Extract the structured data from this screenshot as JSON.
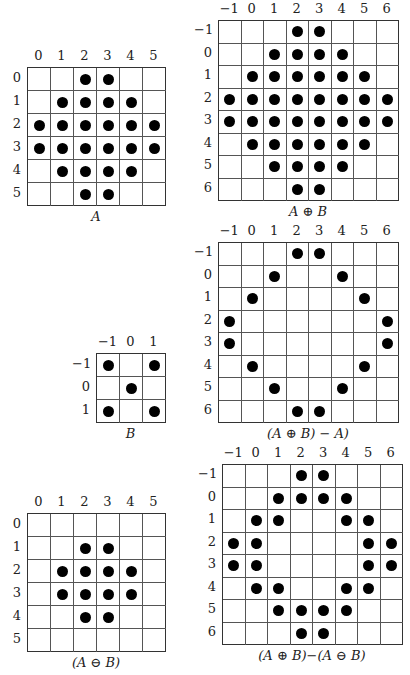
{
  "figures": [
    {
      "id": "A",
      "caption": "A",
      "cols": [
        0,
        1,
        2,
        3,
        4,
        5
      ],
      "rows": [
        0,
        1,
        2,
        3,
        4,
        5
      ],
      "x": 27,
      "y": 67,
      "cell": 23,
      "points": [
        [
          0,
          2
        ],
        [
          0,
          3
        ],
        [
          1,
          1
        ],
        [
          1,
          2
        ],
        [
          1,
          3
        ],
        [
          1,
          4
        ],
        [
          2,
          0
        ],
        [
          2,
          1
        ],
        [
          2,
          2
        ],
        [
          2,
          3
        ],
        [
          2,
          4
        ],
        [
          2,
          5
        ],
        [
          3,
          0
        ],
        [
          3,
          1
        ],
        [
          3,
          2
        ],
        [
          3,
          3
        ],
        [
          3,
          4
        ],
        [
          3,
          5
        ],
        [
          4,
          1
        ],
        [
          4,
          2
        ],
        [
          4,
          3
        ],
        [
          4,
          4
        ],
        [
          5,
          2
        ],
        [
          5,
          3
        ]
      ]
    },
    {
      "id": "A-dilate-B",
      "caption": "A ⊕ B",
      "cols": [
        -1,
        0,
        1,
        2,
        3,
        4,
        5,
        6
      ],
      "rows": [
        -1,
        0,
        1,
        2,
        3,
        4,
        5,
        6
      ],
      "x": 218,
      "y": 20,
      "cell": 22.5,
      "points": [
        [
          -1,
          2
        ],
        [
          -1,
          3
        ],
        [
          0,
          1
        ],
        [
          0,
          2
        ],
        [
          0,
          3
        ],
        [
          0,
          4
        ],
        [
          1,
          0
        ],
        [
          1,
          1
        ],
        [
          1,
          2
        ],
        [
          1,
          3
        ],
        [
          1,
          4
        ],
        [
          1,
          5
        ],
        [
          2,
          -1
        ],
        [
          2,
          0
        ],
        [
          2,
          1
        ],
        [
          2,
          2
        ],
        [
          2,
          3
        ],
        [
          2,
          4
        ],
        [
          2,
          5
        ],
        [
          2,
          6
        ],
        [
          3,
          -1
        ],
        [
          3,
          0
        ],
        [
          3,
          1
        ],
        [
          3,
          2
        ],
        [
          3,
          3
        ],
        [
          3,
          4
        ],
        [
          3,
          5
        ],
        [
          3,
          6
        ],
        [
          4,
          0
        ],
        [
          4,
          1
        ],
        [
          4,
          2
        ],
        [
          4,
          3
        ],
        [
          4,
          4
        ],
        [
          4,
          5
        ],
        [
          5,
          1
        ],
        [
          5,
          2
        ],
        [
          5,
          3
        ],
        [
          5,
          4
        ],
        [
          6,
          2
        ],
        [
          6,
          3
        ]
      ]
    },
    {
      "id": "B",
      "caption": "B",
      "cols": [
        -1,
        0,
        1
      ],
      "rows": [
        -1,
        0,
        1
      ],
      "x": 96,
      "y": 353,
      "cell": 23,
      "points": [
        [
          -1,
          -1
        ],
        [
          -1,
          1
        ],
        [
          0,
          0
        ],
        [
          1,
          -1
        ],
        [
          1,
          1
        ]
      ]
    },
    {
      "id": "dilate-minus-A",
      "caption": "(A ⊕ B) − A)",
      "cols": [
        -1,
        0,
        1,
        2,
        3,
        4,
        5,
        6
      ],
      "rows": [
        -1,
        0,
        1,
        2,
        3,
        4,
        5,
        6
      ],
      "x": 218,
      "y": 242,
      "cell": 22.5,
      "points": [
        [
          -1,
          2
        ],
        [
          -1,
          3
        ],
        [
          0,
          1
        ],
        [
          0,
          4
        ],
        [
          1,
          0
        ],
        [
          1,
          5
        ],
        [
          2,
          -1
        ],
        [
          2,
          6
        ],
        [
          3,
          -1
        ],
        [
          3,
          6
        ],
        [
          4,
          0
        ],
        [
          4,
          5
        ],
        [
          5,
          1
        ],
        [
          5,
          4
        ],
        [
          6,
          2
        ],
        [
          6,
          3
        ]
      ]
    },
    {
      "id": "A-erode-B",
      "caption": "(A ⊖ B)",
      "cols": [
        0,
        1,
        2,
        3,
        4,
        5
      ],
      "rows": [
        0,
        1,
        2,
        3,
        4,
        5
      ],
      "x": 27,
      "y": 513,
      "cell": 23,
      "points": [
        [
          1,
          2
        ],
        [
          1,
          3
        ],
        [
          2,
          1
        ],
        [
          2,
          2
        ],
        [
          2,
          3
        ],
        [
          2,
          4
        ],
        [
          3,
          1
        ],
        [
          3,
          2
        ],
        [
          3,
          3
        ],
        [
          3,
          4
        ],
        [
          4,
          2
        ],
        [
          4,
          3
        ]
      ]
    },
    {
      "id": "dilate-minus-erode",
      "caption": "(A ⊕ B)−(A ⊖ B)",
      "cols": [
        -1,
        0,
        1,
        2,
        3,
        4,
        5,
        6
      ],
      "rows": [
        -1,
        0,
        1,
        2,
        3,
        4,
        5,
        6
      ],
      "x": 222,
      "y": 464,
      "cell": 22.5,
      "points": [
        [
          -1,
          2
        ],
        [
          -1,
          3
        ],
        [
          0,
          1
        ],
        [
          0,
          2
        ],
        [
          0,
          3
        ],
        [
          0,
          4
        ],
        [
          1,
          0
        ],
        [
          1,
          1
        ],
        [
          1,
          4
        ],
        [
          1,
          5
        ],
        [
          2,
          -1
        ],
        [
          2,
          0
        ],
        [
          2,
          5
        ],
        [
          2,
          6
        ],
        [
          3,
          -1
        ],
        [
          3,
          0
        ],
        [
          3,
          5
        ],
        [
          3,
          6
        ],
        [
          4,
          0
        ],
        [
          4,
          1
        ],
        [
          4,
          4
        ],
        [
          4,
          5
        ],
        [
          5,
          1
        ],
        [
          5,
          2
        ],
        [
          5,
          3
        ],
        [
          5,
          4
        ],
        [
          6,
          2
        ],
        [
          6,
          3
        ]
      ]
    }
  ]
}
